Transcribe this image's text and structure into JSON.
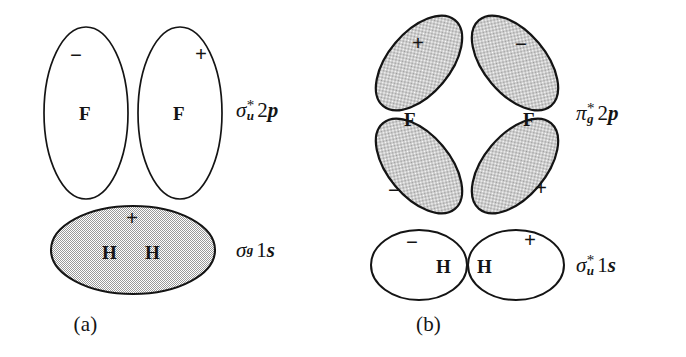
{
  "figure": {
    "background_color": "#ffffff",
    "stroke_color": "#141414",
    "shade_fill": "#c9c9c9"
  },
  "panels": [
    {
      "id": "a",
      "caption": "(a)",
      "orbitals": [
        {
          "name": "sigma-u-star-2p",
          "symbol": "σ",
          "superscript": "*",
          "subscript": "u",
          "shell_number": "2",
          "shell_letter": "p",
          "shaded": false,
          "atom_label": "F",
          "lobes": [
            {
              "sign": "−",
              "atom": "F"
            },
            {
              "sign": "+",
              "atom": "F"
            }
          ]
        },
        {
          "name": "sigma-g-1s",
          "symbol": "σ",
          "superscript": "",
          "subscript": "g",
          "shell_number": "1",
          "shell_letter": "s",
          "shaded": true,
          "atom_label": "H",
          "lobes": [
            {
              "sign": "+",
              "atom": "H"
            },
            {
              "sign": "",
              "atom": "H"
            }
          ]
        }
      ]
    },
    {
      "id": "b",
      "caption": "(b)",
      "orbitals": [
        {
          "name": "pi-g-star-2p",
          "symbol": "π",
          "superscript": "*",
          "subscript": "g",
          "shell_number": "2",
          "shell_letter": "p",
          "shaded": true,
          "atom_label": "F",
          "lobes": [
            {
              "sign": "+",
              "position": "top-left"
            },
            {
              "sign": "−",
              "position": "top-right"
            },
            {
              "sign": "−",
              "position": "bottom-left"
            },
            {
              "sign": "+",
              "position": "bottom-right"
            }
          ]
        },
        {
          "name": "sigma-u-star-1s",
          "symbol": "σ",
          "superscript": "*",
          "subscript": "u",
          "shell_number": "1",
          "shell_letter": "s",
          "shaded": false,
          "atom_label": "H",
          "lobes": [
            {
              "sign": "−",
              "atom": "H"
            },
            {
              "sign": "+",
              "atom": "H"
            }
          ]
        }
      ]
    }
  ],
  "atoms": {
    "fluorine": "F",
    "hydrogen": "H"
  },
  "signs": {
    "plus": "+",
    "minus": "−"
  }
}
